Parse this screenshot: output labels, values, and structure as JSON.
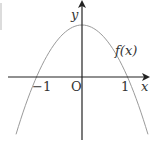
{
  "chart_data": {
    "type": "line",
    "title": "",
    "xlabel": "x",
    "ylabel": "y",
    "origin_label": "O",
    "x_ticks": [
      {
        "value": -1,
        "label": "−1"
      },
      {
        "value": 1,
        "label": "1"
      }
    ],
    "series": [
      {
        "name": "f(x)",
        "expression": "f(x) = 1 - x^2 (downward parabola, roots at -1 and 1, vertex on y-axis)",
        "x": [
          -1.4,
          -1.2,
          -1.0,
          -0.8,
          -0.6,
          -0.4,
          -0.2,
          0.0,
          0.2,
          0.4,
          0.6,
          0.8,
          1.0,
          1.2,
          1.4
        ],
        "y": [
          -0.96,
          -0.44,
          0.0,
          0.36,
          0.64,
          0.84,
          0.96,
          1.0,
          0.96,
          0.84,
          0.64,
          0.36,
          0.0,
          -0.44,
          -0.96
        ],
        "color": "#9a9a9a"
      }
    ],
    "xlim": [
      -1.6,
      1.45
    ],
    "ylim": [
      -1.2,
      1.5
    ],
    "grid": false,
    "legend": "inline label f(x) near curve right branch",
    "axis_color": "#333333"
  },
  "labels": {
    "y_axis": "y",
    "x_axis": "x",
    "origin": "O",
    "tick_neg1": "−1",
    "tick_pos1": "1",
    "curve": "f(x)"
  }
}
